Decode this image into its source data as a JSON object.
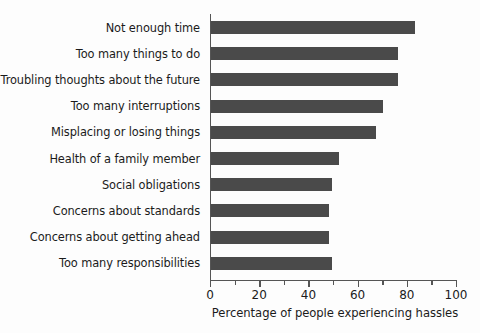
{
  "chart_data": {
    "type": "bar",
    "orientation": "horizontal",
    "title": "",
    "xlabel": "Percentage of people experiencing hassles",
    "ylabel": "",
    "xlim": [
      0,
      100
    ],
    "xticks": [
      0,
      20,
      40,
      60,
      80,
      100
    ],
    "xtick_labels": [
      "0",
      "20",
      "40",
      "60",
      "80",
      "100"
    ],
    "minor_xticks": [
      10,
      30,
      50,
      70,
      90
    ],
    "grid": false,
    "legend": false,
    "bar_color": "#4a4a4a",
    "background_color": "#fdfdfd",
    "axis_color": "#555555",
    "categories": [
      "Not enough time",
      "Too many things to do",
      "Troubling thoughts about the future",
      "Too many interruptions",
      "Misplacing or losing things",
      "Health of a family member",
      "Social obligations",
      "Concerns about standards",
      "Concerns about getting ahead",
      "Too many responsibilities"
    ],
    "values": [
      83,
      76,
      76,
      70,
      67,
      52,
      49,
      48,
      48,
      49
    ]
  }
}
